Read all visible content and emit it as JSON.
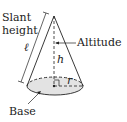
{
  "labels": {
    "slant_line1": "Slant",
    "slant_line2": "height",
    "altitude": "Altitude",
    "base": "Base",
    "ell": "ℓ",
    "h": "h",
    "r": "r"
  },
  "colors": {
    "stroke": "#222222",
    "base_fill": "#e3e3e3"
  }
}
